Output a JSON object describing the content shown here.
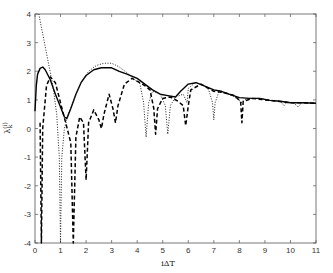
{
  "chart_data": {
    "type": "line",
    "title": "",
    "xlabel": "iΔT",
    "ylabel": "λ_k^(i)",
    "xlim": [
      0,
      11
    ],
    "ylim": [
      -4,
      4
    ],
    "grid": false,
    "legend": null,
    "x_ticks": [
      0,
      1,
      2,
      3,
      4,
      5,
      6,
      7,
      8,
      9,
      10,
      11
    ],
    "y_ticks": [
      -4,
      -3,
      -2,
      -1,
      0,
      1,
      2,
      3,
      4
    ],
    "series": [
      {
        "name": "solid",
        "style": "solid",
        "points": [
          [
            0.0,
            0.6
          ],
          [
            0.05,
            1.5
          ],
          [
            0.1,
            1.9
          ],
          [
            0.2,
            2.1
          ],
          [
            0.3,
            2.15
          ],
          [
            0.4,
            2.05
          ],
          [
            0.6,
            1.7
          ],
          [
            0.8,
            1.2
          ],
          [
            1.0,
            0.75
          ],
          [
            1.15,
            0.4
          ],
          [
            1.25,
            0.35
          ],
          [
            1.4,
            0.7
          ],
          [
            1.6,
            1.2
          ],
          [
            1.8,
            1.6
          ],
          [
            2.0,
            1.85
          ],
          [
            2.3,
            2.05
          ],
          [
            2.6,
            2.12
          ],
          [
            3.0,
            2.12
          ],
          [
            3.3,
            2.0
          ],
          [
            3.6,
            1.9
          ],
          [
            4.0,
            1.75
          ],
          [
            4.3,
            1.55
          ],
          [
            4.6,
            1.35
          ],
          [
            4.9,
            1.2
          ],
          [
            5.2,
            1.15
          ],
          [
            5.5,
            1.1
          ],
          [
            5.7,
            1.3
          ],
          [
            6.0,
            1.55
          ],
          [
            6.3,
            1.6
          ],
          [
            6.6,
            1.5
          ],
          [
            7.0,
            1.35
          ],
          [
            7.3,
            1.3
          ],
          [
            7.6,
            1.2
          ],
          [
            8.0,
            1.08
          ],
          [
            8.4,
            1.05
          ],
          [
            8.8,
            1.05
          ],
          [
            9.2,
            0.98
          ],
          [
            9.6,
            0.95
          ],
          [
            10.0,
            0.9
          ],
          [
            10.5,
            0.9
          ],
          [
            11.0,
            0.88
          ]
        ]
      },
      {
        "name": "dotted",
        "style": "dotted",
        "points": [
          [
            0.15,
            4.0
          ],
          [
            0.3,
            3.3
          ],
          [
            0.5,
            2.4
          ],
          [
            0.7,
            1.5
          ],
          [
            0.85,
            0.5
          ],
          [
            0.95,
            -1.0
          ],
          [
            1.0,
            -4.0
          ],
          [
            1.05,
            -1.0
          ],
          [
            1.15,
            0.0
          ],
          [
            1.3,
            0.5
          ],
          [
            1.5,
            0.95
          ],
          [
            1.8,
            1.6
          ],
          [
            2.1,
            2.0
          ],
          [
            2.4,
            2.2
          ],
          [
            2.7,
            2.28
          ],
          [
            3.0,
            2.28
          ],
          [
            3.3,
            2.15
          ],
          [
            3.6,
            1.95
          ],
          [
            3.9,
            1.7
          ],
          [
            4.1,
            1.6
          ],
          [
            4.25,
            0.9
          ],
          [
            4.35,
            -0.3
          ],
          [
            4.45,
            0.9
          ],
          [
            4.6,
            1.3
          ],
          [
            4.9,
            1.2
          ],
          [
            5.1,
            0.8
          ],
          [
            5.2,
            -0.2
          ],
          [
            5.3,
            0.8
          ],
          [
            5.5,
            1.1
          ],
          [
            5.8,
            1.2
          ],
          [
            5.95,
            0.9
          ],
          [
            6.0,
            1.4
          ],
          [
            6.3,
            1.62
          ],
          [
            6.6,
            1.5
          ],
          [
            6.8,
            1.35
          ],
          [
            6.95,
            0.9
          ],
          [
            7.0,
            0.3
          ],
          [
            7.05,
            0.9
          ],
          [
            7.2,
            1.28
          ],
          [
            7.6,
            1.2
          ],
          [
            7.9,
            1.05
          ],
          [
            8.1,
            0.9
          ],
          [
            8.3,
            1.05
          ],
          [
            8.8,
            1.05
          ],
          [
            9.2,
            0.98
          ],
          [
            9.6,
            0.95
          ],
          [
            9.75,
            0.8
          ],
          [
            9.85,
            0.9
          ],
          [
            10.1,
            0.92
          ],
          [
            10.3,
            0.75
          ],
          [
            10.45,
            0.9
          ],
          [
            11.0,
            0.88
          ]
        ]
      },
      {
        "name": "dashed",
        "style": "dashed",
        "points": [
          [
            0.2,
            0.2
          ],
          [
            0.25,
            -4.0
          ],
          [
            0.3,
            0.0
          ],
          [
            0.45,
            1.5
          ],
          [
            0.6,
            1.8
          ],
          [
            0.8,
            1.6
          ],
          [
            1.0,
            0.9
          ],
          [
            1.2,
            0.2
          ],
          [
            1.4,
            -0.5
          ],
          [
            1.5,
            -4.0
          ],
          [
            1.6,
            -0.3
          ],
          [
            1.75,
            0.4
          ],
          [
            1.9,
            0.2
          ],
          [
            2.0,
            -1.8
          ],
          [
            2.1,
            0.2
          ],
          [
            2.3,
            0.65
          ],
          [
            2.5,
            0.3
          ],
          [
            2.6,
            0.0
          ],
          [
            2.7,
            0.5
          ],
          [
            2.9,
            1.2
          ],
          [
            3.05,
            0.7
          ],
          [
            3.15,
            0.2
          ],
          [
            3.25,
            0.8
          ],
          [
            3.5,
            1.55
          ],
          [
            3.8,
            1.75
          ],
          [
            4.1,
            1.6
          ],
          [
            4.3,
            1.5
          ],
          [
            4.5,
            1.35
          ],
          [
            4.65,
            0.7
          ],
          [
            4.72,
            -0.2
          ],
          [
            4.8,
            0.7
          ],
          [
            5.0,
            1.05
          ],
          [
            5.3,
            1.1
          ],
          [
            5.6,
            0.95
          ],
          [
            5.8,
            0.8
          ],
          [
            5.9,
            0.1
          ],
          [
            6.0,
            0.8
          ],
          [
            6.1,
            1.35
          ],
          [
            6.5,
            1.55
          ],
          [
            7.0,
            1.3
          ],
          [
            7.4,
            1.25
          ],
          [
            7.8,
            1.15
          ],
          [
            8.05,
            0.95
          ],
          [
            8.1,
            0.2
          ],
          [
            8.15,
            0.95
          ],
          [
            8.5,
            1.05
          ],
          [
            9.0,
            1.0
          ],
          [
            9.5,
            0.95
          ],
          [
            10.0,
            0.9
          ],
          [
            10.5,
            0.9
          ],
          [
            11.0,
            0.88
          ]
        ]
      }
    ]
  }
}
